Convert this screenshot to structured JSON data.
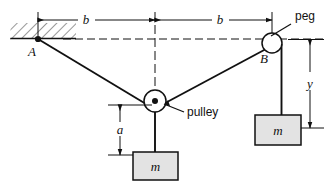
{
  "figure": {
    "background_color": "#ffffff",
    "line_color": "#111111",
    "block_fill": "#e3e3e3",
    "hatch_color": "#444444"
  },
  "labels": {
    "dim_b_left": "b",
    "dim_b_right": "b",
    "dim_a": "a",
    "dim_y": "y",
    "point_a": "A",
    "point_b": "B",
    "peg": "peg",
    "pulley": "pulley",
    "mass_bottom": "m",
    "mass_right": "m"
  },
  "geometry": {
    "anchor_a": {
      "x": 38,
      "y": 39
    },
    "peg_center": {
      "x": 272,
      "y": 43
    },
    "peg_radius": 10,
    "pulley_center": {
      "x": 155,
      "y": 101
    },
    "pulley_radius": 11,
    "ceiling_y": 39,
    "hatch_rect": {
      "x": 10,
      "y": 23,
      "w": 66,
      "h": 15
    },
    "centerline_x": 155,
    "dim_b_y": 20,
    "dim_a_x": 120,
    "dim_a_top": 105,
    "dim_a_bottom": 155,
    "dim_y_x": 310,
    "dim_y_top": 40,
    "dim_y_bottom": 128,
    "block_bottom": {
      "x": 133,
      "y": 152,
      "w": 45,
      "h": 28
    },
    "block_right": {
      "x": 255,
      "y": 115,
      "w": 46,
      "h": 30
    }
  }
}
